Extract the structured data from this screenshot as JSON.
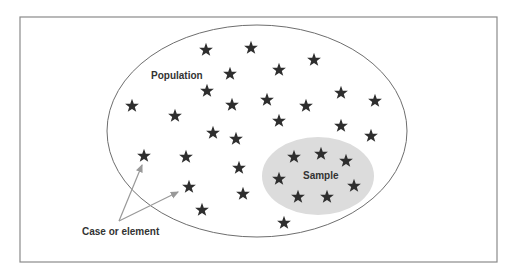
{
  "diagram": {
    "labels": {
      "population": "Population",
      "sample": "Sample",
      "case": "Case or element"
    },
    "colors": {
      "frame": "#8a8a8a",
      "ellipse_stroke": "#6e6e6e",
      "sample_fill": "#dcdcdc",
      "star": "#2e2e2e",
      "arrow": "#999999",
      "text": "#333333"
    },
    "population_stars": [
      [
        206,
        50
      ],
      [
        251,
        48
      ],
      [
        230,
        74
      ],
      [
        279,
        70
      ],
      [
        314,
        60
      ],
      [
        207,
        91
      ],
      [
        132,
        106
      ],
      [
        175,
        116
      ],
      [
        232,
        105
      ],
      [
        267,
        100
      ],
      [
        306,
        106
      ],
      [
        341,
        93
      ],
      [
        375,
        101
      ],
      [
        213,
        133
      ],
      [
        236,
        139
      ],
      [
        279,
        121
      ],
      [
        341,
        126
      ],
      [
        371,
        136
      ],
      [
        144,
        156
      ],
      [
        186,
        157
      ],
      [
        239,
        168
      ],
      [
        189,
        187
      ],
      [
        243,
        194
      ],
      [
        202,
        210
      ],
      [
        284,
        223
      ]
    ],
    "sample_stars": [
      [
        294,
        157
      ],
      [
        321,
        154
      ],
      [
        346,
        161
      ],
      [
        279,
        179
      ],
      [
        354,
        186
      ],
      [
        298,
        197
      ],
      [
        327,
        197
      ]
    ]
  }
}
